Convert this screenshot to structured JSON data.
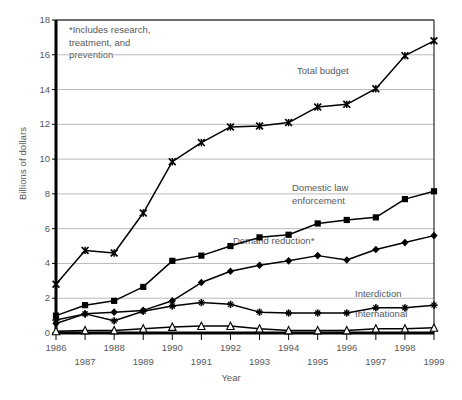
{
  "chart_data": {
    "type": "line",
    "title": "",
    "xlabel": "Year",
    "ylabel": "Billions of dollars",
    "ylim": [
      0,
      18
    ],
    "yticks": [
      "0",
      "2",
      "4",
      "6",
      "8",
      "10",
      "12",
      "14",
      "16",
      "18"
    ],
    "grid": "horizontal",
    "legend_position": "inline-annotations",
    "categories": [
      "1986",
      "1987",
      "1988",
      "1989",
      "1990",
      "1991",
      "1992",
      "1993",
      "1994",
      "1995",
      "1996",
      "1997",
      "1998",
      "1999"
    ],
    "annotations": [
      "*Includes research, treatment, and prevention"
    ],
    "series": [
      {
        "name": "Total budget",
        "marker": "x-cross",
        "values": [
          2.8,
          4.75,
          4.6,
          6.9,
          9.85,
          10.95,
          11.85,
          11.9,
          12.1,
          13.0,
          13.15,
          14.05,
          15.95,
          16.8
        ]
      },
      {
        "name": "Domestic law enforcement",
        "marker": "square",
        "values": [
          1.0,
          1.6,
          1.85,
          2.65,
          4.15,
          4.45,
          5.0,
          5.5,
          5.65,
          6.3,
          6.5,
          6.65,
          7.7,
          8.15
        ]
      },
      {
        "name": "Demand reduction*",
        "marker": "diamond",
        "values": [
          0.55,
          1.1,
          1.2,
          1.3,
          1.85,
          2.9,
          3.55,
          3.9,
          4.15,
          4.45,
          4.2,
          4.8,
          5.2,
          5.6
        ]
      },
      {
        "name": "Interdiction",
        "marker": "star",
        "values": [
          0.75,
          1.1,
          0.7,
          1.25,
          1.55,
          1.75,
          1.65,
          1.2,
          1.15,
          1.15,
          1.15,
          1.45,
          1.45,
          1.6
        ]
      },
      {
        "name": "International",
        "marker": "triangle",
        "values": [
          0.1,
          0.15,
          0.15,
          0.25,
          0.35,
          0.4,
          0.4,
          0.25,
          0.15,
          0.15,
          0.15,
          0.25,
          0.25,
          0.3
        ]
      }
    ]
  },
  "labels": {
    "total_budget": "Total budget",
    "domestic_law_enforcement_line1": "Domestic law",
    "domestic_law_enforcement_line2": "enforcement",
    "demand_reduction": "Demand reduction*",
    "interdiction": "Interdiction",
    "international": "International",
    "note_line1": "*Includes research,",
    "note_line2": "treatment, and",
    "note_line3": "prevention",
    "ylabel": "Billions of dollars",
    "xlabel": "Year"
  },
  "colors": {
    "ink": "#000000",
    "text": "#58595b",
    "grid": "#b9babc",
    "axis": "#000000",
    "background": "#ffffff"
  }
}
